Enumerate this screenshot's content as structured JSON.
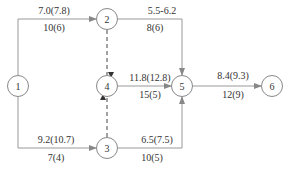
{
  "nodes": [
    {
      "id": "1",
      "label": "1"
    },
    {
      "id": "2",
      "label": "2"
    },
    {
      "id": "3",
      "label": "3"
    },
    {
      "id": "4",
      "label": "4"
    },
    {
      "id": "5",
      "label": "5"
    },
    {
      "id": "6",
      "label": "6"
    }
  ],
  "edges": {
    "e12": {
      "from": "1",
      "to": "2",
      "top": "7.0(7.8)",
      "bottom": "10(6)",
      "style": "solid"
    },
    "e25": {
      "from": "2",
      "to": "5",
      "top": "5.5-6.2",
      "bottom": "8(6)",
      "style": "solid"
    },
    "e24": {
      "from": "2",
      "to": "4",
      "style": "dashed"
    },
    "e45": {
      "from": "4",
      "to": "5",
      "top": "11.8(12.8)",
      "bottom": "15(5)",
      "style": "solid"
    },
    "e56": {
      "from": "5",
      "to": "6",
      "top": "8.4(9.3)",
      "bottom": "12(9)",
      "style": "solid"
    },
    "e13": {
      "from": "1",
      "to": "3",
      "top": "9.2(10.7)",
      "bottom": "7(4)",
      "style": "solid"
    },
    "e34": {
      "from": "3",
      "to": "4",
      "style": "dashed"
    },
    "e35": {
      "from": "3",
      "to": "5",
      "top": "6.5(7.5)",
      "bottom": "10(5)",
      "style": "solid"
    }
  },
  "colors": {
    "line": "#999999",
    "text": "#333333",
    "node_border": "#888888"
  }
}
